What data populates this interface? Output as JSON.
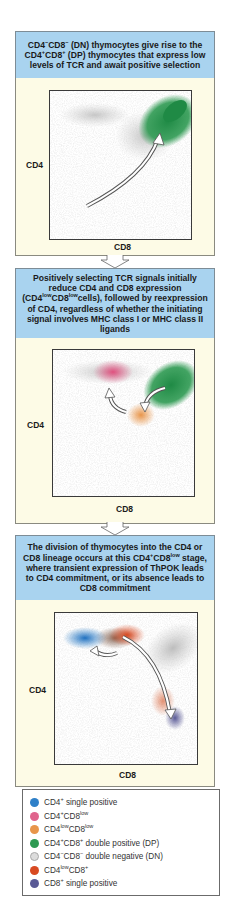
{
  "colors": {
    "header_bg": "#a9d3ef",
    "body_bg": "#fdfbe6",
    "cd4_single_positive": "#2f80c8",
    "cd4pos_cd8low": "#e0648c",
    "cd4low_cd8low": "#e8954a",
    "double_positive": "#2e9a52",
    "double_negative": "#d4d4d4",
    "cd4low_cd8pos": "#d84a22",
    "cd8_single_positive": "#5a5a96"
  },
  "panels": [
    {
      "header_html": "CD4<sup>&minus;</sup>CD8<sup>&minus;</sup> (DN) thymocytes give rise to the CD4<sup>+</sup>CD8<sup>+</sup> (DP) thymocytes that express low levels of TCR and await positive selection",
      "header_text": "CD4−CD8− (DN) thymocytes give rise to the CD4+CD8+ (DP) thymocytes that express low levels of TCR and await positive selection",
      "y_axis_label": "CD4",
      "x_axis_label": "CD8"
    },
    {
      "header_html": "Positively selecting TCR signals initially reduce CD4 and CD8 expression (CD4<sup>low</sup>CD8<sup>low</sup>cells), followed by reexpression of CD4, regardless of whether the initiating signal involves MHC class I or MHC class II ligands",
      "header_text": "Positively selecting TCR signals initially reduce CD4 and CD8 expression (CD4lowCD8lowcells), followed by reexpression of CD4, regardless of whether the initiating signal involves MHC class I or MHC class II ligands",
      "y_axis_label": "CD4",
      "x_axis_label": "CD8"
    },
    {
      "header_html": "The division of thymocytes into the CD4 or CD8 lineage occurs at this CD4<sup>+</sup>CD8<sup>low</sup> stage, where transient expression of ThPOK leads to CD4 commitment, or its absence leads to CD8 commitment",
      "header_text": "The division of thymocytes into the CD4 or CD8 lineage occurs at this CD4+CD8low stage, where transient expression of ThPOK leads to CD4 commitment, or its absence leads to CD8 commitment",
      "y_axis_label": "CD4",
      "x_axis_label": "CD8"
    }
  ],
  "legend": {
    "items": [
      {
        "label_html": "CD4<sup>+</sup> single positive",
        "label": "CD4+ single positive",
        "color": "#2f80c8"
      },
      {
        "label_html": "CD4<sup>+</sup>CD8<sup>low</sup>",
        "label": "CD4+CD8low",
        "color": "#e0648c"
      },
      {
        "label_html": "CD4<sup>low</sup>CD8<sup>low</sup>",
        "label": "CD4lowCD8low",
        "color": "#e8954a"
      },
      {
        "label_html": "CD4<sup>+</sup>CD8<sup>+</sup> double positive (DP)",
        "label": "CD4+CD8+ double positive (DP)",
        "color": "#2e9a52"
      },
      {
        "label_html": "CD4<sup>&minus;</sup>CD8<sup>&minus;</sup> double negative (DN)",
        "label": "CD4−CD8− double negative (DN)",
        "color": "#dcdcdc"
      },
      {
        "label_html": "CD4<sup>low</sup>CD8<sup>+</sup>",
        "label": "CD4lowCD8+",
        "color": "#d84a22"
      },
      {
        "label_html": "CD8<sup>+</sup> single positive",
        "label": "CD8+ single positive",
        "color": "#5a5a96"
      }
    ]
  }
}
